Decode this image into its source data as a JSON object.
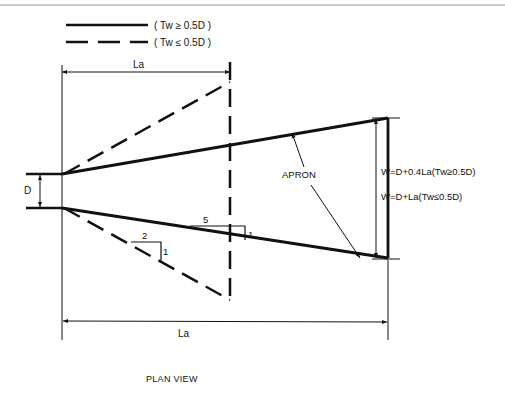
{
  "diagram": {
    "type": "engineering-plan-view",
    "title": "PLAN VIEW",
    "legend": [
      {
        "line_style": "solid",
        "label": "( Tw ≥ 0.5D )"
      },
      {
        "line_style": "dashed",
        "label": "( Tw ≤ 0.5D )"
      }
    ],
    "labels": {
      "pipe_diameter": "D",
      "top_length": "La",
      "bottom_length": "La",
      "apron": "APRON",
      "width_formula_1": "W=D+0.4La(Tw≥0.5D)",
      "width_formula_2": "W=D+La(Tw≤0.5D)",
      "slope_solid_run": "5",
      "slope_solid_rise": "1",
      "slope_dashed_run": "2",
      "slope_dashed_rise": "1"
    },
    "colors": {
      "background": "#ffffff",
      "ink": "#111111",
      "frame_line": "#9a9a9a"
    }
  }
}
